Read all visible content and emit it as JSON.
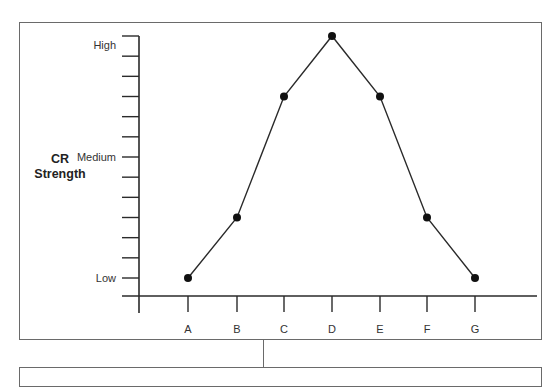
{
  "chart_data": {
    "type": "line",
    "title": "",
    "ylabel": "CR Strength",
    "ylabel_lines": [
      "CR",
      "Strength"
    ],
    "xlabel": "",
    "categories": [
      "A",
      "B",
      "C",
      "D",
      "E",
      "F",
      "G"
    ],
    "values": [
      0,
      3,
      9,
      12,
      9,
      3,
      0
    ],
    "ylim": [
      0,
      12
    ],
    "y_tick_count": 13,
    "y_tick_labels": [
      {
        "value": 12,
        "label": "High"
      },
      {
        "value": 6,
        "label": "Medium"
      },
      {
        "value": 0,
        "label": "Low"
      }
    ],
    "markers": true,
    "grid": false,
    "legend": null,
    "line_color": "#2a2a2a"
  }
}
